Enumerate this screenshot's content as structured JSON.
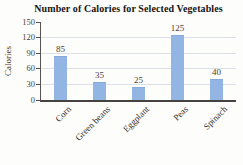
{
  "chart_data": {
    "type": "bar",
    "title": "Number of Calories for Selected Vegetables",
    "categories": [
      "Corn",
      "Green beans",
      "Eggplant",
      "Peas",
      "Spinach"
    ],
    "values": [
      85,
      35,
      25,
      125,
      40
    ],
    "xlabel": "",
    "ylabel": "Calories",
    "ylim": [
      0,
      150
    ],
    "yticks": [
      0,
      30,
      60,
      90,
      120,
      150
    ],
    "grid": "horizontal-light",
    "legend": "none",
    "bar_color": "#93b5e3",
    "axis_color": "#56524e",
    "gridline_color": "#dce1e8"
  }
}
